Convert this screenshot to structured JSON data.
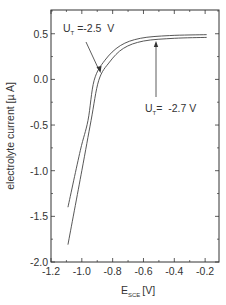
{
  "chart_data": {
    "type": "line",
    "title": "",
    "xlabel": "E_SCE [V]",
    "xlabel_main": "E",
    "xlabel_sub": "SCE",
    "xlabel_unit": "[V]",
    "ylabel": "electrolyte current [µ A]",
    "xlim": [
      -1.2,
      -0.11
    ],
    "ylim": [
      -2.0,
      0.76
    ],
    "xticks": [
      -1.2,
      -1.0,
      -0.8,
      -0.6,
      -0.4,
      -0.2
    ],
    "xtick_labels": [
      "-1.2",
      "-1.0",
      "-0.8",
      "-0.6",
      "-0.4",
      "-0.2"
    ],
    "yticks": [
      0.5,
      0.0,
      -0.5,
      -1.0,
      -1.5,
      -2.0
    ],
    "ytick_labels": [
      "0.5",
      "0.0",
      "-0.5",
      "-1.0",
      "-1.5",
      "-2.0"
    ],
    "grid": false,
    "legend": "none (inline annotations)",
    "series": [
      {
        "name": "U_T = -2.5 V",
        "x": [
          -1.09,
          -1.01,
          -0.96,
          -0.92,
          -0.85,
          -0.75,
          -0.62,
          -0.43,
          -0.19
        ],
        "y": [
          -1.4,
          -0.78,
          -0.45,
          -0.01,
          0.21,
          0.37,
          0.45,
          0.48,
          0.49
        ]
      },
      {
        "name": "U_T = -2.7 V",
        "x": [
          -1.09,
          -1.0,
          -0.94,
          -0.89,
          -0.82,
          -0.73,
          -0.6,
          -0.4,
          -0.19
        ],
        "y": [
          -1.81,
          -1.0,
          -0.45,
          -0.01,
          0.19,
          0.34,
          0.42,
          0.45,
          0.46
        ]
      }
    ],
    "annotations": [
      {
        "text": "U_T =-2.5 V",
        "main": "U",
        "sub": "T",
        "rest": " =-2.5  V",
        "points_to": "U_T = -2.5 V curve"
      },
      {
        "text": "U_T= -2.7 V",
        "main": "U",
        "sub": "T",
        "rest": "=  -2.7 V",
        "points_to": "U_T = -2.7 V curve"
      }
    ]
  }
}
